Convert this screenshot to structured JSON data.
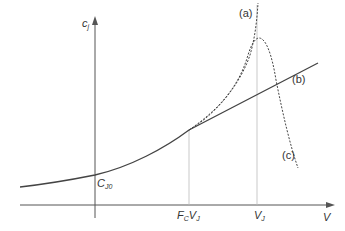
{
  "diagram": {
    "axes": {
      "y_label": "c",
      "y_label_sub": "j",
      "x_label": "V"
    },
    "points": {
      "intercept_label": "C",
      "intercept_sub": "J0",
      "fc_label_f": "F",
      "fc_label_f_sub": "C",
      "fc_label_v": "V",
      "fc_label_v_sub": "J",
      "vj_label": "V",
      "vj_label_sub": "J"
    },
    "curves": [
      {
        "id": "a",
        "label": "(a)",
        "style": "dashed",
        "description": "ideal junction capacitance diverging at V_J"
      },
      {
        "id": "b",
        "label": "(b)",
        "style": "solid",
        "description": "linear extrapolation above F_C V_J"
      },
      {
        "id": "c",
        "label": "(c)",
        "style": "dashed",
        "description": "actual capacitance peaking near V_J then falling"
      }
    ],
    "colors": {
      "line": "#444444",
      "guide": "#bbbbbb",
      "axis": "#555555"
    }
  }
}
